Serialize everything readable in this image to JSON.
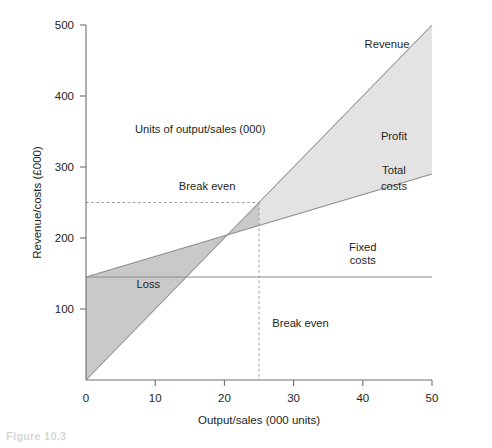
{
  "figure": {
    "caption": "Figure 10.3"
  },
  "chart_data": {
    "type": "line",
    "title": "",
    "xlabel": "Output/sales (000 units)",
    "ylabel": "Revenue/costs (£000)",
    "xlim": [
      0,
      50
    ],
    "ylim": [
      0,
      500
    ],
    "xticks": [
      0,
      10,
      20,
      30,
      40,
      50
    ],
    "xticklabels": [
      "0",
      "10",
      "20",
      "30",
      "40",
      "50"
    ],
    "yticks": [
      100,
      200,
      300,
      400,
      500
    ],
    "yticklabels": [
      "100",
      "200",
      "300",
      "400",
      "500"
    ],
    "grid": false,
    "legend": "none (inline labels)",
    "series": [
      {
        "name": "Revenue",
        "x": [
          0,
          50
        ],
        "values": [
          0,
          500
        ],
        "label": "Revenue",
        "color": "#8c8c8c"
      },
      {
        "name": "Total costs",
        "x": [
          0,
          50
        ],
        "values": [
          145,
          290
        ],
        "label": "Total costs",
        "color": "#8c8c8c"
      },
      {
        "name": "Fixed costs",
        "x": [
          0,
          50
        ],
        "values": [
          145,
          145
        ],
        "label": "Fixed costs",
        "color": "#8c8c8c"
      }
    ],
    "regions": [
      {
        "name": "Loss",
        "label": "Loss",
        "fill": "#c9c9c9",
        "x_range": [
          0,
          25
        ],
        "between": [
          "Revenue",
          "Total costs"
        ]
      },
      {
        "name": "Profit",
        "label": "Profit",
        "fill": "#e3e3e3",
        "x_range": [
          25,
          50
        ],
        "between": [
          "Revenue",
          "Total costs"
        ]
      }
    ],
    "break_even": {
      "x": 25,
      "y": 250,
      "vertical_label": "Break even",
      "horizontal_label": "Break even",
      "guide_style": "dashed"
    },
    "annotations": [
      {
        "name": "units-note",
        "text": "Units of output/sales (000)",
        "x": 16.5,
        "y": 348
      },
      {
        "name": "revenue-label",
        "text": "Revenue",
        "x": 43.5,
        "y": 467
      },
      {
        "name": "profit-label",
        "text": "Profit",
        "x": 44.5,
        "y": 338
      },
      {
        "name": "total-costs-label-1",
        "text": "Total",
        "x": 44.5,
        "y": 290
      },
      {
        "name": "total-costs-label-2",
        "text": "costs",
        "x": 44.5,
        "y": 268
      },
      {
        "name": "fixed-costs-label-1",
        "text": "Fixed",
        "x": 40,
        "y": 182
      },
      {
        "name": "fixed-costs-label-2",
        "text": "costs",
        "x": 40,
        "y": 164
      },
      {
        "name": "loss-label",
        "text": "Loss",
        "x": 9,
        "y": 130
      },
      {
        "name": "break-even-h-label",
        "text": "Break even",
        "x": 17.5,
        "y": 268
      },
      {
        "name": "break-even-v-label",
        "text": "Break even",
        "x": 31,
        "y": 75
      }
    ]
  },
  "axis_labels": {
    "x": "Output/sales (000 units)",
    "y": "Revenue/costs (£000)"
  },
  "colors": {
    "loss_fill": "#c9c9c9",
    "profit_fill": "#e3e3e3",
    "line": "#8c8c8c",
    "axis": "#6d6e71",
    "text": "#231f20"
  }
}
